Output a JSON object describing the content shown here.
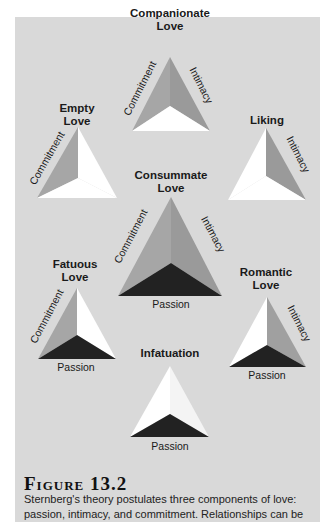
{
  "figure": {
    "title": "Figure 13.2",
    "caption_line1": "Sternberg's theory postulates three components of love:",
    "caption_line2": "passion, intimacy, and commitment. Relationships can be"
  },
  "colors": {
    "panel": "#d9d9d9",
    "face_gray": "#a0a0a0",
    "face_gray_light": "#b3b3b3",
    "face_white": "#ffffff",
    "face_dark": "#222222"
  },
  "diagrams": {
    "companionate": {
      "title1": "Companionate",
      "title2": "Love",
      "left": "Commitment",
      "right": "Intimacy"
    },
    "empty": {
      "title1": "Empty",
      "title2": "Love",
      "left": "Commitment"
    },
    "liking": {
      "title1": "Liking",
      "right": "Intimacy"
    },
    "consummate": {
      "title1": "Consummate",
      "title2": "Love",
      "left": "Commitment",
      "right": "Intimacy",
      "bottom": "Passion"
    },
    "fatuous": {
      "title1": "Fatuous",
      "title2": "Love",
      "left": "Commitment",
      "bottom": "Passion"
    },
    "romantic": {
      "title1": "Romantic",
      "title2": "Love",
      "right": "Intimacy",
      "bottom": "Passion"
    },
    "infatuation": {
      "title1": "Infatuation",
      "bottom": "Passion"
    }
  }
}
